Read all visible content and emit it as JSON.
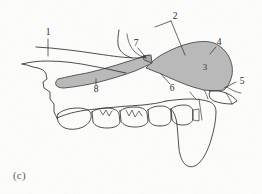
{
  "figure": {
    "caption": "(c)",
    "background_color": "#fdfdfc",
    "ink_color": "#2f2f2f",
    "shade_fill_color": "#b9b9b9",
    "shade_stroke_color": "#4a4a4a"
  },
  "labels": [
    {
      "id": "1",
      "text": "1",
      "x": 48,
      "y": 33,
      "leader": "vertical tick crossing the upper palatal line"
    },
    {
      "id": "2",
      "text": "2",
      "x": 175,
      "y": 17,
      "leader": "v-shaped leader down-left to temporalis tendon"
    },
    {
      "id": "3",
      "text": "3",
      "x": 205,
      "y": 68,
      "leader": "none, sits inside shaded masseter body"
    },
    {
      "id": "4",
      "text": "4",
      "x": 219,
      "y": 43,
      "leader": "short stroke down-left to shaded upper border"
    },
    {
      "id": "5",
      "text": "5",
      "x": 242,
      "y": 82,
      "leader": "horizontal leader left to lower posterior corner"
    },
    {
      "id": "6",
      "text": "6",
      "x": 172,
      "y": 88,
      "leader": "leader up-left to lower border of shaded band"
    },
    {
      "id": "7",
      "text": "7",
      "x": 136,
      "y": 44,
      "leader": "leader down-right to junction point of bands"
    },
    {
      "id": "8",
      "text": "8",
      "x": 96,
      "y": 89,
      "leader": "vertical leader up to lower edge of left shaded band"
    }
  ],
  "regions": [
    {
      "name": "shaded-band-anterior",
      "label_ref": "8",
      "description": "tapered gray band running from left toward the junction"
    },
    {
      "name": "shaded-mass-posterior",
      "label_ref": "3",
      "description": "large gray rounded mass at posterior upper region"
    },
    {
      "name": "tooth-row",
      "description": "row of six cheek teeth along the lower border"
    },
    {
      "name": "ramus-process",
      "description": "large vertical bone process at the posterior right"
    },
    {
      "name": "anterior-palate",
      "description": "zig-zag anterior incisor / palatal outline at left"
    }
  ]
}
